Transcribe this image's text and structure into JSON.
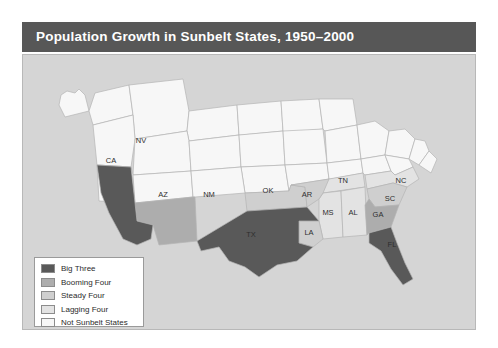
{
  "title": "Population Growth in Sunbelt States, 1950–2000",
  "source": "Source: Fannie Mae Foundation.",
  "colors": {
    "title_bar": "#575757",
    "map_background": "#d5d5d5",
    "big_three": "#595959",
    "booming_four": "#adadad",
    "steady_four": "#cfcfcf",
    "lagging_four": "#e3e3e3",
    "not_sunbelt": "#f7f7f7",
    "state_border": "#b4b4b4",
    "panel_border": "#b8b8b8"
  },
  "legend": {
    "items": [
      {
        "label": "Big Three",
        "color": "#595959"
      },
      {
        "label": "Booming Four",
        "color": "#adadad"
      },
      {
        "label": "Steady Four",
        "color": "#cfcfcf"
      },
      {
        "label": "Lagging Four",
        "color": "#e3e3e3"
      },
      {
        "label": "Not Sunbelt States",
        "color": "#f7f7f7"
      }
    ]
  },
  "map": {
    "state_labels": [
      {
        "code": "NV",
        "x": 118,
        "y": 88
      },
      {
        "code": "CA",
        "x": 88,
        "y": 108
      },
      {
        "code": "AZ",
        "x": 140,
        "y": 142
      },
      {
        "code": "NM",
        "x": 186,
        "y": 142
      },
      {
        "code": "OK",
        "x": 245,
        "y": 138
      },
      {
        "code": "TX",
        "x": 228,
        "y": 182
      },
      {
        "code": "AR",
        "x": 284,
        "y": 142
      },
      {
        "code": "LA",
        "x": 286,
        "y": 178
      },
      {
        "code": "MS",
        "x": 305,
        "y": 160
      },
      {
        "code": "AL",
        "x": 328,
        "y": 160
      },
      {
        "code": "TN",
        "x": 320,
        "y": 126
      },
      {
        "code": "GA",
        "x": 351,
        "y": 162
      },
      {
        "code": "FL",
        "x": 369,
        "y": 188
      },
      {
        "code": "SC",
        "x": 371,
        "y": 150
      },
      {
        "code": "NC",
        "x": 376,
        "y": 130
      }
    ],
    "categories": {
      "big_three": [
        "CA",
        "TX",
        "FL"
      ],
      "booming_four": [
        "AZ",
        "NM",
        "NV",
        "GA"
      ],
      "steady_four": [
        "OK",
        "AR",
        "LA",
        "SC"
      ],
      "lagging_four": [
        "MS",
        "AL",
        "TN",
        "NC"
      ]
    }
  }
}
